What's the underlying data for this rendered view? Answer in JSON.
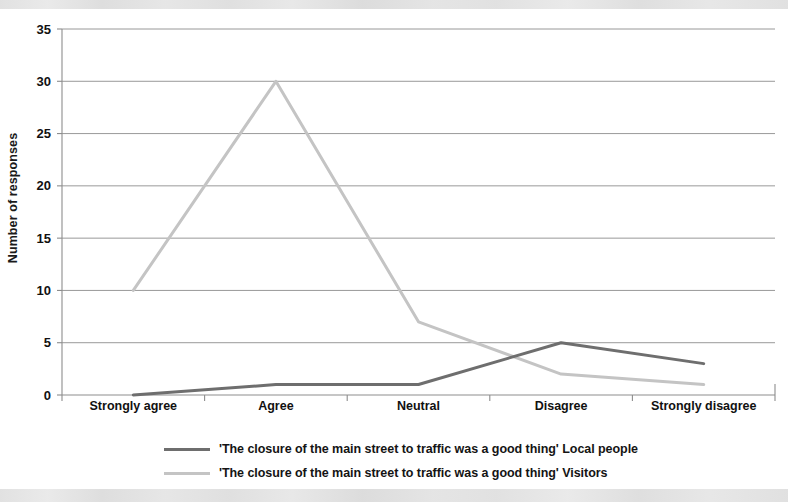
{
  "chart_data": {
    "type": "line",
    "title": "",
    "xlabel": "",
    "ylabel": "Number of responses",
    "categories": [
      "Strongly agree",
      "Agree",
      "Neutral",
      "Disagree",
      "Strongly disagree"
    ],
    "ylim": [
      0,
      35
    ],
    "ytick_step": 5,
    "yticks": [
      0,
      5,
      10,
      15,
      20,
      25,
      30,
      35
    ],
    "grid": true,
    "legend_position": "bottom",
    "series": [
      {
        "name": "'The closure of the main street to traffic was a good thing' Local people",
        "color": "#6e6e6e",
        "values": [
          0,
          1,
          1,
          5,
          3
        ]
      },
      {
        "name": "'The closure of the main street to traffic was a good thing' Visitors",
        "color": "#c4c4c4",
        "values": [
          10,
          30,
          7,
          2,
          1
        ]
      }
    ]
  },
  "axis": {
    "ytick_labels": [
      "35",
      "30",
      "25",
      "20",
      "15",
      "10",
      "5",
      "0"
    ],
    "ylabel": "Number of responses"
  },
  "xaxis": {
    "labels": [
      "Strongly agree",
      "Agree",
      "Neutral",
      "Disagree",
      "Strongly disagree"
    ]
  },
  "legend": {
    "items": [
      {
        "label": "'The closure of the main street to traffic was a good thing' Local people",
        "color": "#6e6e6e"
      },
      {
        "label": "'The closure of the main street to traffic was a good thing' Visitors",
        "color": "#c4c4c4"
      }
    ]
  }
}
